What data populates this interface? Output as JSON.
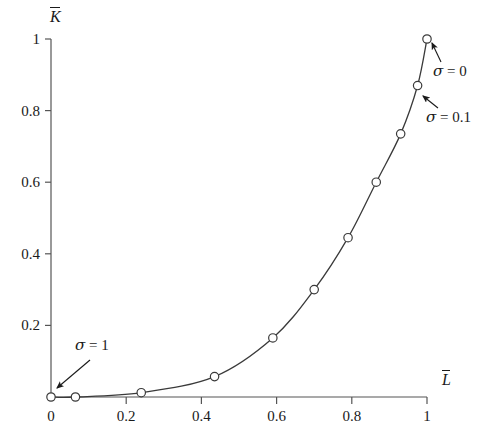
{
  "chart_data": {
    "type": "line",
    "title": "",
    "subtitle": "",
    "xlabel": "L",
    "xlabel_overbar": true,
    "ylabel": "K",
    "ylabel_overbar": true,
    "xlim": [
      0,
      1.06
    ],
    "ylim": [
      0,
      1.06
    ],
    "grid": false,
    "legend": "none",
    "marker": "open-circle",
    "line_color": "#3a3a3a",
    "marker_edge_color": "#3a3a3a",
    "marker_face_color": "#ffffff",
    "axis_color": "#555555",
    "xticks": [
      0,
      0.2,
      0.4,
      0.6,
      0.8,
      1
    ],
    "xticklabels": [
      "0",
      "0.2",
      "0.4",
      "0.6",
      "0.8",
      "1"
    ],
    "yticks": [
      0.2,
      0.4,
      0.6,
      0.8,
      1
    ],
    "yticklabels": [
      "0.2",
      "0.4",
      "0.6",
      "0.8",
      "1"
    ],
    "series": [
      {
        "name": "K vs L",
        "x": [
          0.0,
          0.065,
          0.24,
          0.435,
          0.59,
          0.7,
          0.79,
          0.865,
          0.93,
          0.975,
          1.0
        ],
        "y": [
          0.0,
          0.0,
          0.012,
          0.057,
          0.165,
          0.3,
          0.445,
          0.6,
          0.735,
          0.87,
          1.0
        ]
      }
    ],
    "annotations": [
      {
        "id": "sigma-1",
        "text": "σ = 1",
        "symbol": "σ",
        "relation": "=",
        "value": "1",
        "text_x": 0.155,
        "text_y": 0.105,
        "point_x": 0.0,
        "point_y": 0.0
      },
      {
        "id": "sigma-0",
        "text": "σ = 0",
        "symbol": "σ",
        "relation": "=",
        "value": "0",
        "text_x": 1.06,
        "text_y": 0.885,
        "point_x": 1.0,
        "point_y": 1.0
      },
      {
        "id": "sigma-0-1",
        "text": "σ = 0.1",
        "symbol": "σ",
        "relation": "=",
        "value": "0.1",
        "text_x": 1.045,
        "text_y": 0.755,
        "point_x": 0.975,
        "point_y": 0.87
      }
    ]
  }
}
